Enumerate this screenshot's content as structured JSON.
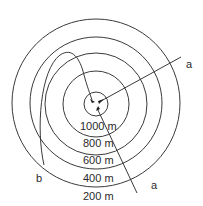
{
  "diagram": {
    "title": "",
    "contours": [
      {
        "label": "200 m",
        "r": 84
      },
      {
        "label": "400 m",
        "r": 66
      },
      {
        "label": "600 m",
        "r": 51
      },
      {
        "label": "800 m",
        "r": 33
      },
      {
        "label": "1000 m",
        "r": 12
      }
    ],
    "center": {
      "x": 96,
      "y": 104
    },
    "section_lines": {
      "a_label_upper": "a",
      "a_label_lower": "a",
      "b_label": "b"
    },
    "colors": {
      "stroke": "#3a3a3a",
      "text": "#2a2a2a",
      "background": "#ffffff"
    }
  }
}
